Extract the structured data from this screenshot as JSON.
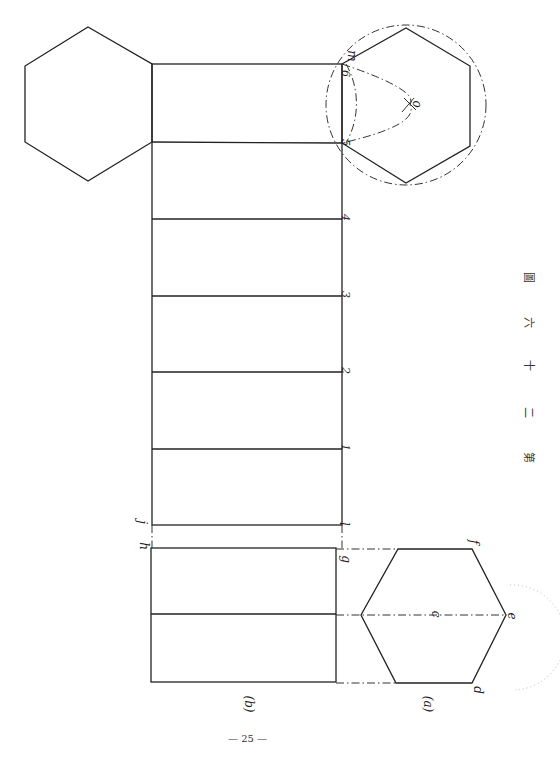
{
  "figure": {
    "caption_chars": [
      "第",
      "二",
      "十",
      "六",
      "圖"
    ],
    "caption": "第二十六圖",
    "page_number": "— 25 —"
  },
  "views": {
    "plan_label": "(a)",
    "elevation_label": "(b)"
  },
  "development": {
    "edge_numbers": [
      "1",
      "2",
      "3",
      "4",
      "5",
      "6"
    ],
    "corner_labels": {
      "top_left": "h",
      "top_left_upper": "j",
      "right_lower": "l",
      "right_g": "g",
      "m": "m",
      "center": "o"
    }
  },
  "plan_hexagon": {
    "vertex_labels": {
      "f": "f",
      "e": "e",
      "d": "d",
      "center": "c"
    }
  },
  "colors": {
    "ink": "#222222",
    "paper": "#ffffff",
    "faint": "#bbbbbb"
  }
}
